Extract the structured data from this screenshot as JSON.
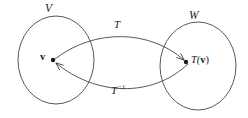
{
  "figure": {
    "type": "diagram",
    "width": 248,
    "height": 118,
    "background_color": "#ffffff",
    "stroke_color": "#3a3a3a"
  },
  "sets": {
    "domain": {
      "label": "V",
      "center_x": 56,
      "center_y": 60,
      "radius_x": 38,
      "radius_y": 44
    },
    "codomain": {
      "label": "W",
      "center_x": 198,
      "center_y": 66,
      "radius_x": 38,
      "radius_y": 44
    }
  },
  "points": {
    "source": {
      "label": "v",
      "x": 53,
      "y": 60
    },
    "image": {
      "label_prefix": "T(",
      "label_vector": "v",
      "label_suffix": ")",
      "x": 186,
      "y": 62
    }
  },
  "maps": {
    "forward": {
      "label": "T",
      "label_superscript": "",
      "direction": "V to W"
    },
    "inverse": {
      "label": "T",
      "label_superscript": "−1",
      "direction": "W to V"
    }
  }
}
